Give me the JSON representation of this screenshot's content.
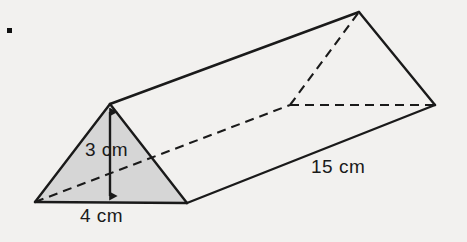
{
  "figure": {
    "kind": "triangular-prism-diagram",
    "background_color": "#f2f1ef",
    "stroke_color": "#1a1a1a",
    "shaded_face_color": "#d6d6d6",
    "corner_dot": "bullet-dot"
  },
  "labels": {
    "height": "3 cm",
    "base": "4 cm",
    "length": "15 cm"
  },
  "measurements": {
    "triangle_height_cm": 3,
    "triangle_base_cm": 4,
    "prism_length_cm": 15
  },
  "geometry": {
    "front_bottom_left": [
      35,
      202
    ],
    "front_apex": [
      110,
      104
    ],
    "front_bottom_right": [
      187,
      203
    ],
    "back_apex": [
      359,
      12
    ],
    "back_bottom_right": [
      435,
      105
    ],
    "back_bottom_left_hidden": [
      290,
      105
    ],
    "height_arrow": {
      "x": 110,
      "y_top": 106,
      "y_bottom": 202
    },
    "dot": [
      9,
      30
    ]
  }
}
